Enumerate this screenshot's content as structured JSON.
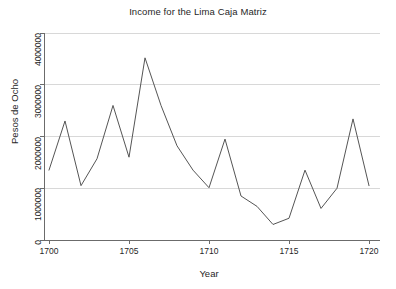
{
  "chart_data": {
    "type": "line",
    "title": "Income for the Lima Caja Matriz",
    "xlabel": "Year",
    "ylabel": "Pesos de Ocho",
    "grid": true,
    "legend": null,
    "xlim": [
      1700,
      1720
    ],
    "ylim": [
      0,
      4200000
    ],
    "xticks": [
      1700,
      1705,
      1710,
      1715,
      1720
    ],
    "xtick_labels": [
      "1700",
      "1705",
      "1710",
      "1715",
      "1720"
    ],
    "yticks": [
      0,
      1000000,
      2000000,
      3000000,
      4000000
    ],
    "ytick_labels": [
      "0",
      "1000000",
      "2000000",
      "3000000",
      "4000000"
    ],
    "x": [
      1700,
      1701,
      1702,
      1703,
      1704,
      1705,
      1706,
      1707,
      1708,
      1709,
      1710,
      1711,
      1712,
      1713,
      1714,
      1715,
      1716,
      1717,
      1718,
      1719,
      1720
    ],
    "values": [
      1350000,
      2300000,
      1050000,
      1570000,
      2600000,
      1600000,
      3520000,
      2600000,
      1820000,
      1350000,
      1010000,
      1950000,
      850000,
      650000,
      300000,
      420000,
      1350000,
      610000,
      1000000,
      2340000,
      1050000
    ],
    "series": [
      {
        "name": "Income",
        "color": "#555555",
        "values": [
          1350000,
          2300000,
          1050000,
          1570000,
          2600000,
          1600000,
          3520000,
          2600000,
          1820000,
          1350000,
          1010000,
          1950000,
          850000,
          650000,
          300000,
          420000,
          1350000,
          610000,
          1000000,
          2340000,
          1050000
        ]
      }
    ]
  },
  "colors": {
    "line": "#555555",
    "grid": "#d8d8d8",
    "axis": "#6b6b6b",
    "text": "#1f1f1f",
    "background": "#ffffff"
  }
}
